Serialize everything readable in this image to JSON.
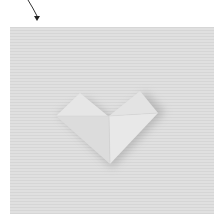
{
  "image": {
    "subject": "Folded origami paper heart on a gray ribbed paper background",
    "background_color": "#dcdcdc",
    "paper_color": "#e6e6e6",
    "arrow": "curved arrow pointing down to the top-left corner of the panel"
  }
}
